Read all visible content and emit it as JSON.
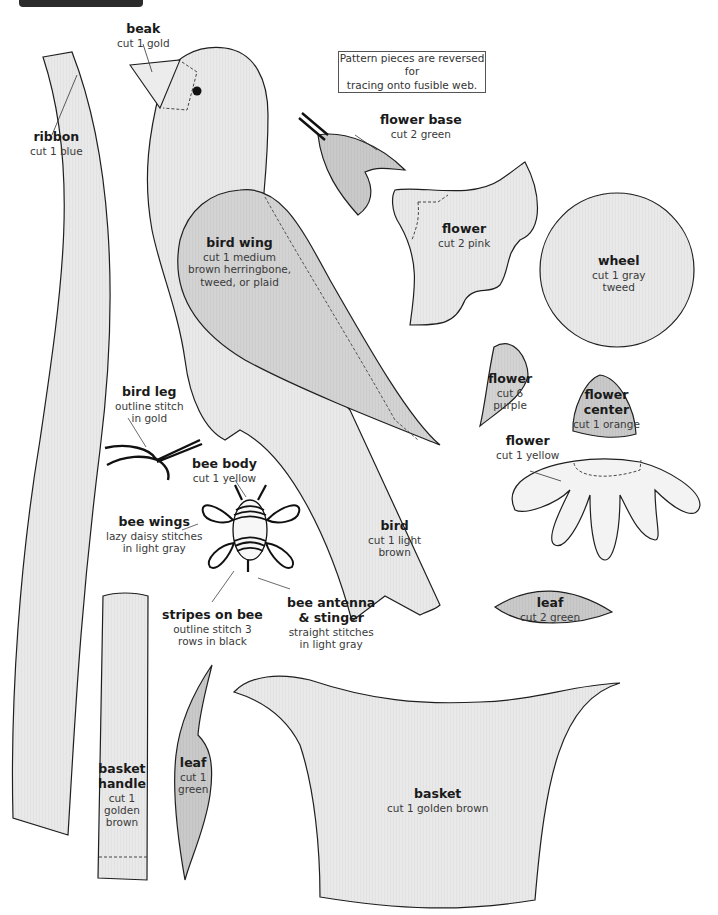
{
  "page": {
    "note_lines": [
      "Pattern pieces are reversed for",
      "tracing onto fusible web."
    ],
    "colors": {
      "piece_fill_light": "#ebebeb",
      "piece_fill_medium": "#d6d6d6",
      "piece_fill_dark": "#cfcfcf",
      "outline": "#1f1f1f",
      "stitch": "#111111"
    }
  },
  "pieces": {
    "beak": {
      "title": "beak",
      "lines": [
        "cut 1 gold"
      ]
    },
    "ribbon": {
      "title": "ribbon",
      "lines": [
        "cut 1 blue"
      ]
    },
    "flower_base": {
      "title": "flower base",
      "lines": [
        "cut 2 green"
      ]
    },
    "bird_wing": {
      "title": "bird wing",
      "lines": [
        "cut 1 medium",
        "brown herringbone,",
        "tweed, or plaid"
      ]
    },
    "flower_pink": {
      "title": "flower",
      "lines": [
        "cut 2 pink"
      ]
    },
    "wheel": {
      "title": "wheel",
      "lines": [
        "cut 1 gray",
        "tweed"
      ]
    },
    "bird_leg": {
      "title": "bird leg",
      "lines": [
        "outline stitch",
        "in gold"
      ]
    },
    "flower_purple": {
      "title": "flower",
      "lines": [
        "cut 6",
        "purple"
      ]
    },
    "flower_center": {
      "title": "flower",
      "title2": "center",
      "lines": [
        "cut 1 orange"
      ]
    },
    "flower_yellow": {
      "title": "flower",
      "lines": [
        "cut 1 yellow"
      ]
    },
    "bee_body": {
      "title": "bee body",
      "lines": [
        "cut 1 yellow"
      ]
    },
    "bee_wings": {
      "title": "bee wings",
      "lines": [
        "lazy daisy stitches",
        "in light gray"
      ]
    },
    "bird": {
      "title": "bird",
      "lines": [
        "cut 1 light",
        "brown"
      ]
    },
    "stripes": {
      "title": "stripes on bee",
      "lines": [
        "outline stitch 3",
        "rows in black"
      ]
    },
    "bee_antenna": {
      "title": "bee antenna",
      "title2": "& stinger",
      "lines": [
        "straight stitches",
        "in light gray"
      ]
    },
    "leaf_small": {
      "title": "leaf",
      "lines": [
        "cut 2 green"
      ]
    },
    "leaf_tall": {
      "title": "leaf",
      "lines": [
        "cut 1",
        "green"
      ]
    },
    "basket_handle": {
      "title": "basket",
      "title2": "handle",
      "lines": [
        "cut 1",
        "golden",
        "brown"
      ]
    },
    "basket": {
      "title": "basket",
      "lines": [
        "cut 1 golden brown"
      ]
    }
  }
}
